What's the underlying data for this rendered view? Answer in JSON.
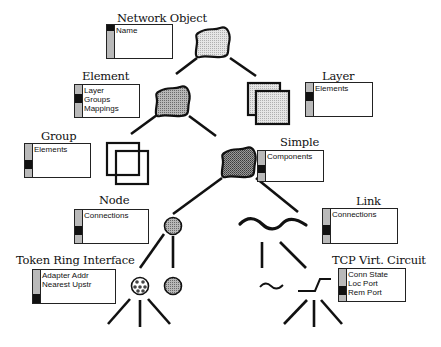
{
  "diagram": {
    "classes": {
      "network_object": {
        "title": "Network Object",
        "attributes": [
          "Name"
        ],
        "sidebar": [
          "black",
          "gray",
          "gray"
        ]
      },
      "element": {
        "title": "Element",
        "attributes": [
          "Layer",
          "Groups",
          "Mappings"
        ],
        "sidebar": [
          "gray",
          "black",
          "gray"
        ]
      },
      "layer": {
        "title": "Layer",
        "attributes": [
          "Elements"
        ],
        "sidebar": [
          "gray",
          "black",
          "gray"
        ]
      },
      "group": {
        "title": "Group",
        "attributes": [
          "Elements"
        ],
        "sidebar": [
          "gray",
          "black",
          "gray"
        ]
      },
      "simple": {
        "title": "Simple",
        "attributes": [
          "Components"
        ],
        "sidebar": [
          "gray",
          "black",
          "gray"
        ]
      },
      "node": {
        "title": "Node",
        "attributes": [
          "Connections"
        ],
        "sidebar": [
          "gray",
          "black",
          "gray"
        ]
      },
      "link": {
        "title": "Link",
        "attributes": [
          "Connections"
        ],
        "sidebar": [
          "gray",
          "black",
          "gray"
        ]
      },
      "token_ring_interface": {
        "title": "Token Ring Interface",
        "attributes": [
          "Adapter Addr",
          "Nearest Upstr"
        ],
        "sidebar": [
          "gray",
          "gray",
          "black"
        ]
      },
      "tcp_virt_circuit": {
        "title": "TCP Virt. Circuit",
        "attributes": [
          "Conn State",
          "Loc Port",
          "Rem Port"
        ],
        "sidebar": [
          "gray",
          "black",
          "gray"
        ]
      }
    },
    "icons": [
      "network-object-blob-icon",
      "element-blob-icon",
      "layer-squares-icon",
      "group-squares-icon",
      "simple-blob-icon",
      "node-circle-icon",
      "link-wave-icon",
      "token-ring-circle-icon",
      "node-circle-child-icon",
      "tilde-link-icon",
      "tcp-zigzag-icon"
    ],
    "colors": {
      "line": "#111111",
      "fill_light": "#d8d8d8",
      "fill_mid": "#a8a8a8",
      "fill_dark": "#8c8c8c",
      "sidebar_gray": "#b9b9b9",
      "sidebar_black": "#111111"
    }
  }
}
